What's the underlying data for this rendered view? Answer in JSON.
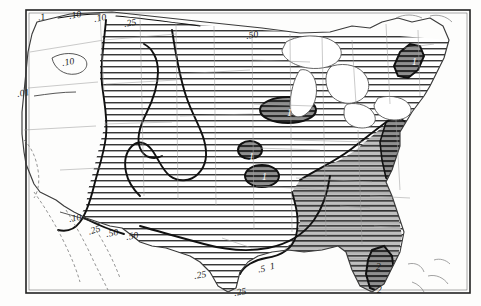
{
  "figure": {
    "type": "contour-map",
    "region": "Contiguous United States",
    "frame_color": "#222222",
    "background_color": "#fdfdfc",
    "shading": {
      "light_hatch_label": "horizontal line hatch",
      "dark_fill_label": "dark grey fill",
      "hatch_color": "#3a3a3a",
      "dark_color": "#7d7d7d",
      "state_border_color": "#9a9a9a",
      "coast_color": "#4a4a4a",
      "contour_color": "#111111"
    }
  },
  "chart_data": {
    "type": "contour",
    "title": "",
    "xlabel": "",
    "ylabel": "",
    "contour_levels": [
      0.01,
      0.1,
      0.25,
      0.5,
      1,
      2
    ],
    "level_labels": [
      ".01",
      ".1",
      ".10",
      ".25",
      ".50",
      ".5",
      "1",
      "2"
    ],
    "labels": [
      {
        "text": ".1",
        "x": 38,
        "y": 12,
        "style": "rot"
      },
      {
        "text": ".10",
        "x": 69,
        "y": 10,
        "style": "rot"
      },
      {
        "text": ".10",
        "x": 94,
        "y": 13,
        "style": "rot"
      },
      {
        "text": ".25",
        "x": 124,
        "y": 18,
        "style": "rot"
      },
      {
        "text": ".50",
        "x": 246,
        "y": 30,
        "style": "rot"
      },
      {
        "text": ".10",
        "x": 62,
        "y": 57,
        "style": "rot"
      },
      {
        "text": ".01",
        "x": 17,
        "y": 88,
        "style": "rot"
      },
      {
        "text": "1",
        "x": 287,
        "y": 108,
        "style": "white"
      },
      {
        "text": "1",
        "x": 412,
        "y": 57,
        "style": "white"
      },
      {
        "text": "1",
        "x": 249,
        "y": 152,
        "style": "white"
      },
      {
        "text": "1",
        "x": 262,
        "y": 172,
        "style": "white"
      },
      {
        "text": ".10",
        "x": 69,
        "y": 213,
        "style": "rot"
      },
      {
        "text": ".25",
        "x": 88,
        "y": 225,
        "style": "rot2"
      },
      {
        "text": ".50",
        "x": 106,
        "y": 228,
        "style": "rot"
      },
      {
        "text": ".50",
        "x": 126,
        "y": 231,
        "style": "rot"
      },
      {
        "text": ".25",
        "x": 194,
        "y": 270,
        "style": "rot"
      },
      {
        "text": ".5",
        "x": 258,
        "y": 264,
        "style": "rot"
      },
      {
        "text": "1",
        "x": 270,
        "y": 261,
        "style": "rot"
      },
      {
        "text": ".25",
        "x": 234,
        "y": 287,
        "style": "rot"
      },
      {
        "text": "2",
        "x": 376,
        "y": 262,
        "style": "plain"
      },
      {
        "text": "2",
        "x": 377,
        "y": 285,
        "style": "plain"
      }
    ]
  },
  "map": {
    "title": "",
    "caption": "",
    "features": {
      "outer_frame": "rectangular map border",
      "national_outline": "contiguous US coastline and borders",
      "state_outlines": "light grey internal state boundaries",
      "great_lakes": "unshaded lake polygons",
      "hatched_region": "central and eastern hatched area",
      "dark_regions": "isolated high-value cores"
    }
  }
}
